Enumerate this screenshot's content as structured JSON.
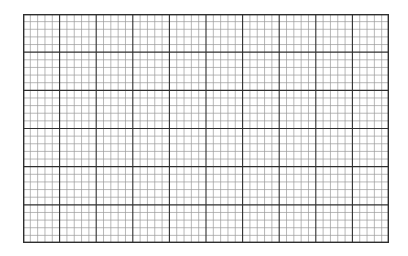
{
  "sheet": {
    "type": "graph-paper",
    "grid": {
      "x": 23,
      "y": 14,
      "width": 366,
      "height": 229,
      "major_columns": 10,
      "major_rows": 6,
      "minor_per_major": 5
    },
    "colors": {
      "background": "#ffffff",
      "minor_line": "#9a9a9a",
      "major_line": "#2e2e2e",
      "border": "#2e2e2e"
    },
    "line_widths": {
      "minor": 0.7,
      "major": 1.1,
      "border": 1.4
    }
  }
}
